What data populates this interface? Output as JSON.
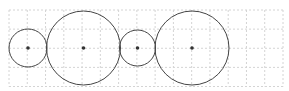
{
  "diagram": {
    "type": "tangent-circles-on-grid",
    "background": "#ffffff",
    "grid": {
      "x0": 9,
      "y0": 10,
      "x1": 283,
      "y1": 86.5,
      "cols": 15,
      "rows": 4,
      "color": "#d4d4d4",
      "dash": "2,2"
    },
    "circle_stroke": "#444444",
    "center_dot_color": "#333333",
    "circles": [
      {
        "id": "circle-1",
        "cx": 28,
        "cy": 48,
        "r": 19
      },
      {
        "id": "circle-2",
        "cx": 83.5,
        "cy": 48,
        "r": 37
      },
      {
        "id": "circle-3",
        "cx": 137.5,
        "cy": 48,
        "r": 18
      },
      {
        "id": "circle-4",
        "cx": 192,
        "cy": 48,
        "r": 37
      }
    ]
  }
}
